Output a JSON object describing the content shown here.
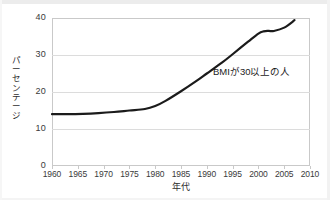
{
  "chart_data": {
    "type": "line",
    "title": "",
    "xlabel": "年代",
    "ylabel": "パーセンテージ",
    "xlim": [
      1960,
      2010
    ],
    "ylim": [
      0,
      40
    ],
    "grid": true,
    "legend": "none",
    "xticks": [
      "1960",
      "1965",
      "1970",
      "1975",
      "1980",
      "1985",
      "1990",
      "1995",
      "2000",
      "2005",
      "2010"
    ],
    "xtick_values": [
      1960,
      1965,
      1970,
      1975,
      1980,
      1985,
      1990,
      1995,
      2000,
      2005,
      2010
    ],
    "yticks": [
      "0",
      "10",
      "20",
      "30",
      "40"
    ],
    "ytick_values": [
      0,
      10,
      20,
      30,
      40
    ],
    "annotations": [
      {
        "text": "BMIが30以上の人",
        "x": 1996,
        "y": 26
      }
    ],
    "series": [
      {
        "name": "BMIが30以上の人",
        "color": "#1b1b1b",
        "line_width": 2.2,
        "x": [
          1960,
          1963,
          1966,
          1969,
          1972,
          1975,
          1978,
          1980,
          1982,
          1985,
          1988,
          1990,
          1993,
          1995,
          1998,
          2000,
          2001,
          2002,
          2003,
          2005,
          2007
        ],
        "values": [
          14.0,
          14.0,
          14.1,
          14.3,
          14.6,
          15.0,
          15.4,
          16.2,
          17.6,
          20.2,
          23.0,
          25.0,
          28.0,
          30.2,
          33.6,
          35.8,
          36.4,
          36.5,
          36.5,
          37.4,
          39.4
        ]
      }
    ]
  }
}
